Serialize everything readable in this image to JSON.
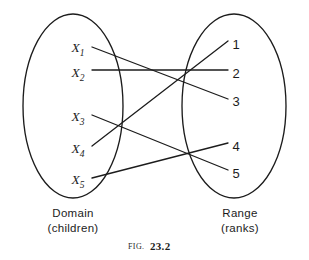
{
  "figure": {
    "caption_prefix": "FIG.",
    "caption_number": "23.2"
  },
  "domain_set": {
    "title": "Domain",
    "subtitle": "(children)",
    "outline_icon": "ellipse-icon",
    "elements": [
      {
        "base": "X",
        "sub": "1",
        "cx": 78,
        "cy": 47
      },
      {
        "base": "X",
        "sub": "2",
        "cx": 78,
        "cy": 72
      },
      {
        "base": "X",
        "sub": "3",
        "cx": 78,
        "cy": 116
      },
      {
        "base": "X",
        "sub": "4",
        "cx": 78,
        "cy": 148
      },
      {
        "base": "X",
        "sub": "5",
        "cx": 78,
        "cy": 179
      }
    ]
  },
  "range_set": {
    "title": "Range",
    "subtitle": "(ranks)",
    "outline_icon": "ellipse-icon",
    "elements": [
      {
        "label": "1",
        "cx": 236,
        "cy": 44
      },
      {
        "label": "2",
        "cx": 236,
        "cy": 73
      },
      {
        "label": "3",
        "cx": 236,
        "cy": 101
      },
      {
        "label": "4",
        "cx": 236,
        "cy": 146
      },
      {
        "label": "5",
        "cx": 236,
        "cy": 173
      }
    ]
  },
  "chart_data": {
    "type": "diagram",
    "title": "FIG. 23.2",
    "subtype": "bipartite-mapping",
    "left_set_label": "Domain (children)",
    "right_set_label": "Range (ranks)",
    "left_nodes": [
      "X1",
      "X2",
      "X3",
      "X4",
      "X5"
    ],
    "right_nodes": [
      "1",
      "2",
      "3",
      "4",
      "5"
    ],
    "mapping": [
      {
        "from": "X1",
        "to": "3"
      },
      {
        "from": "X2",
        "to": "2"
      },
      {
        "from": "X3",
        "to": "5"
      },
      {
        "from": "X4",
        "to": "1"
      },
      {
        "from": "X5",
        "to": "4"
      }
    ],
    "edges": [
      {
        "from": "X1",
        "to": "3",
        "x1": 92,
        "y1": 47,
        "x2": 228,
        "y2": 99
      },
      {
        "from": "X2",
        "to": "2",
        "x1": 92,
        "y1": 70,
        "x2": 228,
        "y2": 70
      },
      {
        "from": "X3",
        "to": "5",
        "x1": 92,
        "y1": 115,
        "x2": 228,
        "y2": 170
      },
      {
        "from": "X4",
        "to": "1",
        "x1": 92,
        "y1": 146,
        "x2": 228,
        "y2": 41
      },
      {
        "from": "X5",
        "to": "4",
        "x1": 92,
        "y1": 178,
        "x2": 228,
        "y2": 143
      }
    ],
    "left_ellipse": {
      "cx": 73,
      "cy": 106,
      "rx": 50,
      "ry": 92
    },
    "right_ellipse": {
      "cx": 234,
      "cy": 106,
      "rx": 52,
      "ry": 92
    },
    "stroke_color": "#1c1c1c",
    "background_color": "#ffffff"
  }
}
